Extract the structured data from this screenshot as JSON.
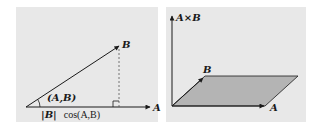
{
  "colors": {
    "page_background": "#ffffff",
    "panel_background": "#e8e8e8",
    "stroke": "#1a1a1a",
    "parallelogram_fill": "#b4b4b4",
    "dashed_line": "#555555"
  },
  "left_panel": {
    "title": "dot product projection",
    "vector_a_label": "A",
    "vector_b_label": "B",
    "angle_label": "(A,B)",
    "projection_label_abs": "|B|",
    "projection_label_cos": "cos(A,B)",
    "right_angle_marker": true
  },
  "right_panel": {
    "title": "cross product parallelogram",
    "cross_product_label": "A×B",
    "vector_a_label": "A",
    "vector_b_label": "B"
  }
}
